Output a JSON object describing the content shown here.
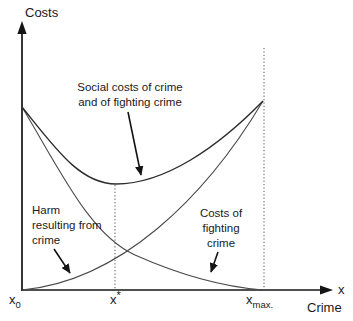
{
  "colors": {
    "background": "#ffffff",
    "axis": "#141414",
    "curve_social": "#2b2b2b",
    "curve_thin": "#4a4a4a",
    "guide": "#5a5a5a",
    "text": "#1a1a1a",
    "arrow": "#141414"
  },
  "axes": {
    "y_label": "Costs",
    "x_arrow_label": "x",
    "x_axis_name": "Crime",
    "ticks": {
      "x0": {
        "base": "x",
        "sub": "0"
      },
      "xstar": {
        "base": "x",
        "sup": "*"
      },
      "xmax": {
        "base": "x",
        "sub": "max."
      }
    }
  },
  "annotations": {
    "social": {
      "lines": [
        "Social costs of crime",
        "and of fighting crime"
      ]
    },
    "harm": {
      "lines": [
        "Harm",
        "resulting from",
        "crime"
      ]
    },
    "fighting": {
      "lines": [
        "Costs of",
        "fighting",
        "crime"
      ]
    }
  },
  "curves": {
    "social": {
      "label": "Social costs of crime and of fighting crime",
      "shape": "U-shaped; starts on y-axis at x0, minimum above x*, rises to meet harm curve at xmax",
      "path": "M 22 107 C 55 148, 80 184, 116 184 C 165 184, 218 147, 263 101"
    },
    "harm": {
      "label": "Harm resulting from crime",
      "shape": "convex increasing from origin (x0, zero) to xmax",
      "path": "M 22 290 C 120 281, 205 198, 263 101"
    },
    "fighting": {
      "label": "Costs of fighting crime",
      "shape": "convex decreasing from same y-axis point as social curve down to zero at xmax",
      "path": "M 22 107 C 60 170, 90 235, 135 255 C 180 275, 225 287, 263 290"
    }
  },
  "guides": {
    "xstar_line": {
      "x": 115,
      "y1": 185,
      "y2": 290
    },
    "xmax_line": {
      "x": 264,
      "y1": 48,
      "y2": 290
    }
  }
}
